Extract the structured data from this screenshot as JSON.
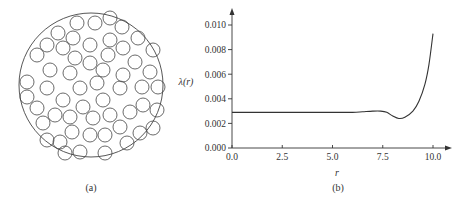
{
  "panels": {
    "a": {
      "label": "(a)",
      "description": "Random packing of small disks within a large circular domain",
      "outer_circle": {
        "cx": 91,
        "cy": 85,
        "r": 72
      },
      "disk_radius": 7,
      "disks": [
        [
          77,
          23
        ],
        [
          95,
          23
        ],
        [
          110,
          18
        ],
        [
          122,
          27
        ],
        [
          58,
          33
        ],
        [
          73,
          38
        ],
        [
          47,
          45
        ],
        [
          90,
          45
        ],
        [
          110,
          40
        ],
        [
          138,
          38
        ],
        [
          37,
          55
        ],
        [
          63,
          48
        ],
        [
          75,
          58
        ],
        [
          108,
          55
        ],
        [
          123,
          48
        ],
        [
          153,
          50
        ],
        [
          90,
          63
        ],
        [
          135,
          62
        ],
        [
          50,
          70
        ],
        [
          70,
          73
        ],
        [
          103,
          70
        ],
        [
          123,
          75
        ],
        [
          150,
          72
        ],
        [
          27,
          82
        ],
        [
          47,
          88
        ],
        [
          80,
          88
        ],
        [
          97,
          83
        ],
        [
          120,
          88
        ],
        [
          142,
          87
        ],
        [
          158,
          87
        ],
        [
          27,
          97
        ],
        [
          63,
          100
        ],
        [
          103,
          100
        ],
        [
          37,
          108
        ],
        [
          83,
          107
        ],
        [
          130,
          112
        ],
        [
          143,
          105
        ],
        [
          157,
          110
        ],
        [
          55,
          115
        ],
        [
          70,
          117
        ],
        [
          93,
          118
        ],
        [
          110,
          115
        ],
        [
          43,
          123
        ],
        [
          120,
          127
        ],
        [
          72,
          132
        ],
        [
          90,
          135
        ],
        [
          105,
          135
        ],
        [
          140,
          133
        ],
        [
          153,
          128
        ],
        [
          47,
          140
        ],
        [
          60,
          142
        ],
        [
          127,
          143
        ],
        [
          65,
          153
        ],
        [
          80,
          152
        ],
        [
          105,
          153
        ]
      ]
    },
    "b": {
      "label": "(b)"
    }
  },
  "chart_data": {
    "type": "line",
    "title": "",
    "xlabel": "r",
    "ylabel": "λ(r)",
    "xlim": [
      0.0,
      10.0
    ],
    "ylim": [
      0.0,
      0.01
    ],
    "xticks": [
      "0.0",
      "2.5",
      "5.0",
      "7.5",
      "10.0"
    ],
    "yticks": [
      "0.000",
      "0.002",
      "0.004",
      "0.006",
      "0.008",
      "0.010"
    ],
    "grid": false,
    "legend": null,
    "series": [
      {
        "name": "λ(r)",
        "x": [
          0.0,
          1.0,
          2.0,
          3.0,
          4.0,
          5.0,
          6.0,
          6.5,
          7.0,
          7.4,
          7.7,
          8.0,
          8.3,
          8.6,
          9.0,
          9.3,
          9.6,
          9.8,
          10.0
        ],
        "y": [
          0.0029,
          0.0029,
          0.0029,
          0.0029,
          0.0029,
          0.0029,
          0.0029,
          0.00295,
          0.003,
          0.003,
          0.0029,
          0.0026,
          0.0024,
          0.0025,
          0.003,
          0.0038,
          0.0052,
          0.0068,
          0.0093
        ]
      }
    ]
  }
}
